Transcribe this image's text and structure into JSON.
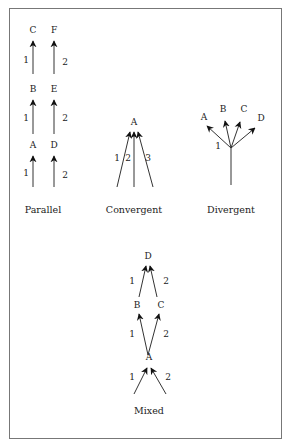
{
  "figure": {
    "frame_color": "#666666",
    "panels": [
      {
        "id": "parallel",
        "caption": "Parallel",
        "nodes": [
          "A",
          "B",
          "C",
          "D",
          "E",
          "F"
        ],
        "paths": [
          {
            "label": "1",
            "sequence": [
              "A",
              "B",
              "C"
            ]
          },
          {
            "label": "2",
            "sequence": [
              "D",
              "E",
              "F"
            ]
          }
        ]
      },
      {
        "id": "convergent",
        "caption": "Convergent",
        "target": "A",
        "arrows": [
          "1",
          "2",
          "3"
        ]
      },
      {
        "id": "divergent",
        "caption": "Divergent",
        "source_label": "1",
        "targets": [
          "A",
          "B",
          "C",
          "D"
        ]
      },
      {
        "id": "mixed",
        "caption": "Mixed",
        "nodes": [
          "A",
          "B",
          "C",
          "D"
        ],
        "edges": [
          {
            "into": "A",
            "labels": [
              "1",
              "2"
            ]
          },
          {
            "from": "A",
            "to": [
              "B",
              "C"
            ],
            "labels": [
              "1",
              "2"
            ]
          },
          {
            "from": [
              "B",
              "C"
            ],
            "to": "D",
            "labels": [
              "1",
              "2"
            ]
          }
        ]
      }
    ]
  }
}
